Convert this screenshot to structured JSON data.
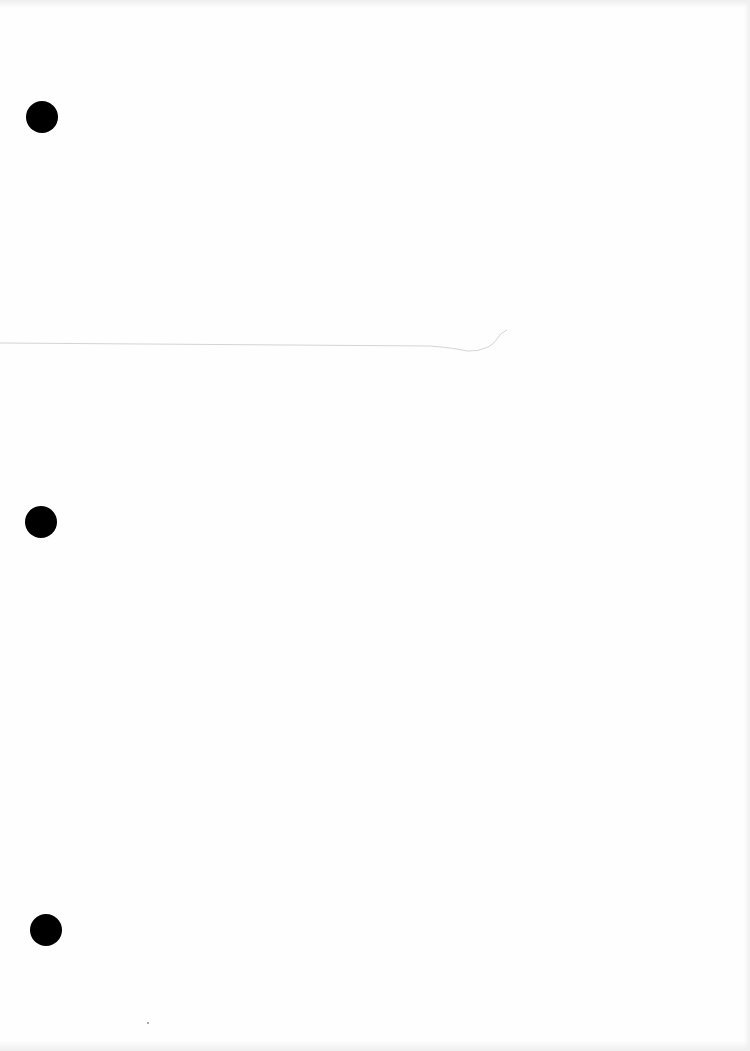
{
  "document": {
    "type": "blank-scanned-page",
    "text": "",
    "punch_holes": [
      {
        "x": 42,
        "y": 117,
        "diameter": 32
      },
      {
        "x": 41,
        "y": 522,
        "diameter": 32
      },
      {
        "x": 46,
        "y": 930,
        "diameter": 32
      }
    ],
    "colors": {
      "paper": "#fefefe",
      "hole": "#000000",
      "fold_line": "#d8d8d8"
    }
  }
}
